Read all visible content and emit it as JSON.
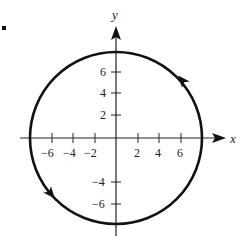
{
  "problem": {
    "number_suffix": "."
  },
  "axes": {
    "x_label": "x",
    "y_label": "y",
    "x_ticks": [
      {
        "value": -6,
        "label": "−6"
      },
      {
        "value": -4,
        "label": "−4"
      },
      {
        "value": -2,
        "label": "−2"
      },
      {
        "value": 2,
        "label": "2"
      },
      {
        "value": 4,
        "label": "4"
      },
      {
        "value": 6,
        "label": "6"
      }
    ],
    "y_ticks": [
      {
        "value": 6,
        "label": "6"
      },
      {
        "value": 4,
        "label": "4"
      },
      {
        "value": 2,
        "label": "2"
      },
      {
        "value": -4,
        "label": "−4"
      },
      {
        "value": -6,
        "label": "−6"
      }
    ]
  },
  "curve": {
    "type": "circle",
    "center": [
      0,
      0
    ],
    "radius": 8,
    "orientation": "counterclockwise",
    "stroke_color": "#111111"
  }
}
